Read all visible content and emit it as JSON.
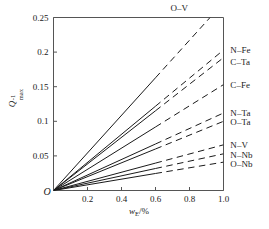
{
  "chart_data": {
    "type": "line",
    "title": "",
    "xlabel": "w_E/%",
    "xlabel_parts": {
      "main": "w",
      "sub": "E",
      "rest": "/%"
    },
    "ylabel": "Q_max^-1",
    "ylabel_parts": {
      "main": "Q",
      "sup": "-1",
      "sub": "max"
    },
    "xlim": [
      0,
      1.04
    ],
    "ylim": [
      0,
      0.26
    ],
    "xticks": [
      0.2,
      0.4,
      0.6,
      0.8,
      1.0
    ],
    "xtick_labels": [
      "0.2",
      "0.4",
      "0.6",
      "0.8",
      "1.0"
    ],
    "yticks": [
      0.05,
      0.1,
      0.15,
      0.2,
      0.25
    ],
    "ytick_labels": [
      "0.05",
      "0.1",
      "0.15",
      "0.2",
      "0.25"
    ],
    "origin_label": "O",
    "grid": false,
    "legend_position": "right-of-axes",
    "solid_dash_break_x": 0.6,
    "line_color": "#1a1a1a",
    "frame_color": "#555555",
    "series": [
      {
        "name": "O-V",
        "label": "O–V",
        "slope": 0.2715,
        "x_end": 0.921,
        "y_end": 0.25,
        "label_x": 0.74,
        "label_y": 0.268
      },
      {
        "name": "N-Fe",
        "label": "N–Fe",
        "slope": 0.203,
        "x_end": 1.0,
        "y_end": 0.203,
        "label_x": 1.04,
        "label_y": 0.203
      },
      {
        "name": "C-Ta",
        "label": "C–Ta",
        "slope": 0.192,
        "x_end": 1.0,
        "y_end": 0.192,
        "label_x": 1.04,
        "label_y": 0.186
      },
      {
        "name": "C-Fe",
        "label": "C–Fe",
        "slope": 0.153,
        "x_end": 1.0,
        "y_end": 0.153,
        "label_x": 1.04,
        "label_y": 0.153
      },
      {
        "name": "N-Ta",
        "label": "N–Ta",
        "slope": 0.112,
        "x_end": 1.0,
        "y_end": 0.112,
        "label_x": 1.04,
        "label_y": 0.112
      },
      {
        "name": "O-Ta",
        "label": "O–Ta",
        "slope": 0.1,
        "x_end": 1.0,
        "y_end": 0.1,
        "label_x": 1.04,
        "label_y": 0.099
      },
      {
        "name": "N-V",
        "label": "N–V",
        "slope": 0.066,
        "x_end": 1.0,
        "y_end": 0.066,
        "label_x": 1.04,
        "label_y": 0.066
      },
      {
        "name": "N-Nb",
        "label": "N–Nb",
        "slope": 0.053,
        "x_end": 1.0,
        "y_end": 0.053,
        "label_x": 1.04,
        "label_y": 0.052
      },
      {
        "name": "O-Nb",
        "label": "O–Nb",
        "slope": 0.041,
        "x_end": 1.0,
        "y_end": 0.041,
        "label_x": 1.04,
        "label_y": 0.039
      }
    ]
  }
}
